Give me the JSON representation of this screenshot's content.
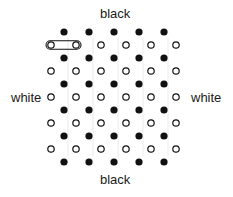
{
  "labels": {
    "top": "black",
    "bottom": "black",
    "left": "white",
    "right": "white"
  },
  "lattice": {
    "black_rows": 6,
    "black_per_row": 5,
    "white_rows": 5,
    "white_per_row": 6,
    "black_x": [
      64,
      89,
      114,
      139,
      164
    ],
    "white_x": [
      51,
      76,
      101,
      126,
      151,
      176
    ],
    "black_y": [
      32,
      58,
      84,
      110,
      136,
      162
    ],
    "white_y": [
      45,
      71,
      97,
      123,
      149
    ],
    "dot_radius": 3.6,
    "black_color": "#111111",
    "white_stroke": "#111111"
  },
  "highlight": {
    "type": "pill",
    "encloses": "first two white dots of top white row",
    "x1": 51,
    "x2": 76,
    "y": 45
  }
}
